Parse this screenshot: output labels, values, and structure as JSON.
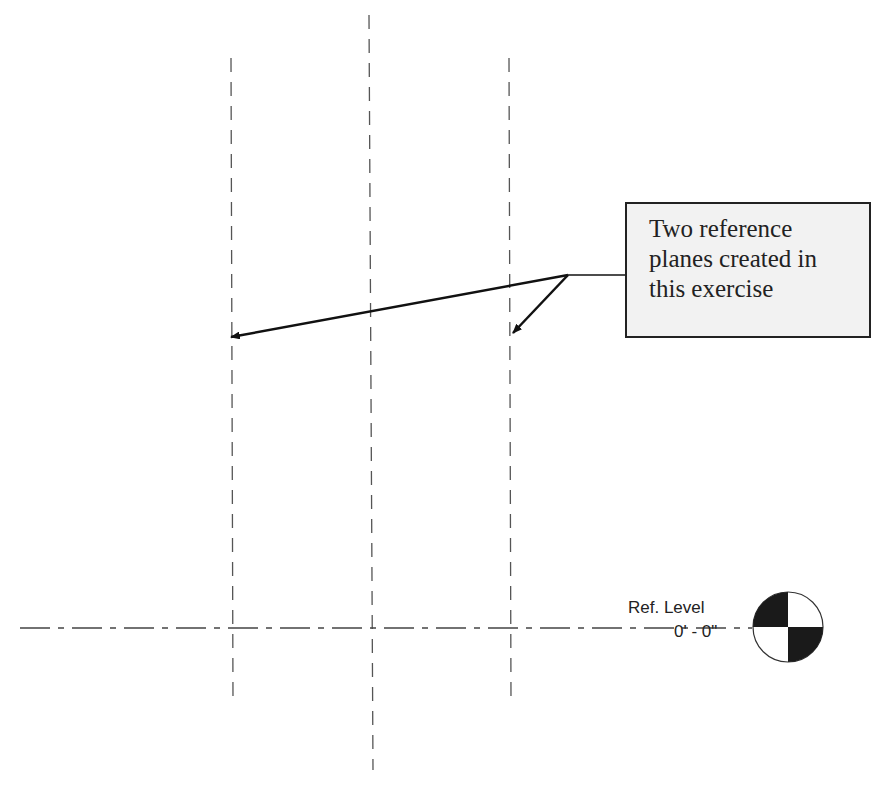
{
  "callout": {
    "text": "Two reference planes created in this exercise",
    "lines": [
      "Two reference",
      "planes created in",
      "this exercise"
    ]
  },
  "level": {
    "name": "Ref. Level",
    "elevation": "0' - 0\""
  },
  "reference_planes": [
    {
      "label": "left reference plane",
      "x": 231
    },
    {
      "label": "center reference plane",
      "x": 370
    },
    {
      "label": "right reference plane",
      "x": 510
    }
  ]
}
